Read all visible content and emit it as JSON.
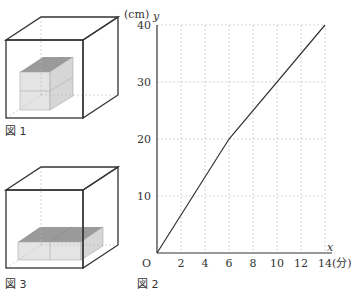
{
  "figures": {
    "fig1": {
      "caption": "図 1",
      "description": "Cube container with a 2-layer stacked block inside"
    },
    "fig3": {
      "caption": "図 3",
      "description": "Cube container with two blocks placed side by side on the bottom"
    },
    "fig2": {
      "caption": "図 2"
    }
  },
  "axes": {
    "y_unit": "(cm)",
    "y_var": "y",
    "x_var": "x",
    "x_unit": "(分)",
    "origin": "O"
  },
  "chart_data": {
    "type": "line",
    "title": "",
    "xlabel": "x (分)",
    "ylabel": "y (cm)",
    "xlim": [
      0,
      14
    ],
    "ylim": [
      0,
      40
    ],
    "x_ticks": [
      "2",
      "4",
      "6",
      "8",
      "10",
      "12",
      "14"
    ],
    "y_ticks": [
      "10",
      "20",
      "30",
      "40"
    ],
    "grid": true,
    "series": [
      {
        "name": "water level",
        "x": [
          0,
          6,
          14
        ],
        "y": [
          0,
          20,
          40
        ]
      }
    ]
  }
}
